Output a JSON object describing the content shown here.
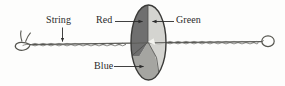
{
  "figure": {
    "labels": {
      "string": "String",
      "red": "Red",
      "green": "Green",
      "blue": "Blue"
    },
    "colors": {
      "red_sector_fill": "#6f6f6f",
      "green_sector_fill": "#d2d2cf",
      "blue_sector_fill": "#a3a3a0",
      "outline": "#3a3a3a",
      "string": "#4a4a48",
      "label_text": "#2b2b2b",
      "background": "#fdfdfc"
    },
    "parts": [
      {
        "name": "string",
        "label": "String",
        "shape": "braided-cord"
      },
      {
        "name": "disk",
        "label": "",
        "shape": "ellipse"
      },
      {
        "name": "red-sector",
        "label": "Red",
        "shade": "dark-gray"
      },
      {
        "name": "green-sector",
        "label": "Green",
        "shade": "light-gray"
      },
      {
        "name": "blue-sector",
        "label": "Blue",
        "shade": "medium-gray"
      },
      {
        "name": "left-knot",
        "label": "",
        "shape": "loop-with-tails"
      },
      {
        "name": "right-loop",
        "label": "",
        "shape": "small-loop"
      }
    ]
  }
}
